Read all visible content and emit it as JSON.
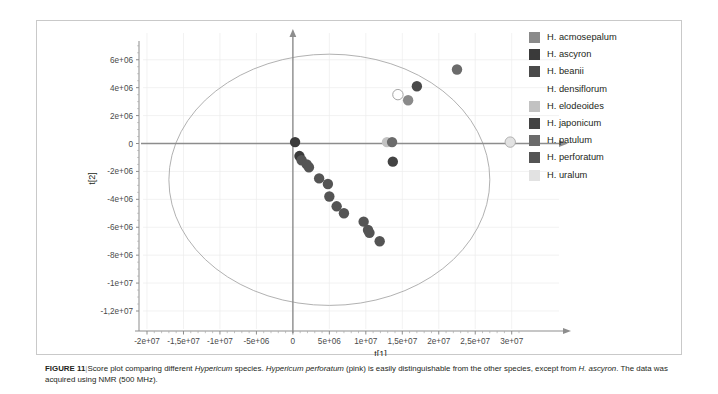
{
  "figure": {
    "number_label": "FIGURE 11",
    "separator": "|",
    "caption_part1": "Score plot comparing different ",
    "caption_italic1": "Hypericum",
    "caption_part2": " species. ",
    "caption_italic2": "Hypericum perforatum",
    "caption_part3": " (pink) is easily distinguishable from the other species, except from ",
    "caption_italic3": "H. ascyron",
    "caption_part4": ". The data was acquired using NMR (500 MHz)."
  },
  "legend": {
    "position": "top-right",
    "items": [
      {
        "label": "H. acmosepalum",
        "color": "#8a8a8a"
      },
      {
        "label": "H. ascyron",
        "color": "#3a3a3a"
      },
      {
        "label": "H. beanii",
        "color": "#4a4a4a"
      },
      {
        "label": "H. densiflorum",
        "color": "#ffffff"
      },
      {
        "label": "H. elodeoides",
        "color": "#c2c2c2"
      },
      {
        "label": "H. japonicum",
        "color": "#434343"
      },
      {
        "label": "H. patulum",
        "color": "#6b6b6b"
      },
      {
        "label": "H. perforatum",
        "color": "#545454"
      },
      {
        "label": "H. uralum",
        "color": "#e2e2e2"
      }
    ]
  },
  "chart_data": {
    "type": "scatter",
    "title": "",
    "xlabel": "t[1]",
    "ylabel": "t[2]",
    "xlim": [
      -20000000,
      31000000
    ],
    "ylim": [
      -12000000,
      7200000
    ],
    "grid": true,
    "confidence_ellipse": {
      "label": "Hotelling T2 (95%)",
      "center_x": 5000000,
      "center_y": -2600000,
      "radius_x": 22000000,
      "radius_y": 9000000
    },
    "xticks": [
      {
        "value": -20000000,
        "label": "-2e+07"
      },
      {
        "value": -15000000,
        "label": "-1,5e+07"
      },
      {
        "value": -10000000,
        "label": "-1e+07"
      },
      {
        "value": -5000000,
        "label": "-5e+06"
      },
      {
        "value": 0,
        "label": "0"
      },
      {
        "value": 5000000,
        "label": "5e+06"
      },
      {
        "value": 10000000,
        "label": "1e+07"
      },
      {
        "value": 15000000,
        "label": "1,5e+07"
      },
      {
        "value": 20000000,
        "label": "2e+07"
      },
      {
        "value": 25000000,
        "label": "2,5e+07"
      },
      {
        "value": 30000000,
        "label": "3e+07"
      }
    ],
    "yticks": [
      {
        "value": 6000000,
        "label": "6e+06"
      },
      {
        "value": 4000000,
        "label": "4e+06"
      },
      {
        "value": 2000000,
        "label": "2e+06"
      },
      {
        "value": 0,
        "label": "0"
      },
      {
        "value": -2000000,
        "label": "-2e+06"
      },
      {
        "value": -4000000,
        "label": "-4e+06"
      },
      {
        "value": -6000000,
        "label": "-6e+06"
      },
      {
        "value": -8000000,
        "label": "-8e+06"
      },
      {
        "value": -10000000,
        "label": "-1e+07"
      },
      {
        "value": -12000000,
        "label": "-1,2e+07"
      }
    ],
    "series": [
      {
        "name": "H. acmosepalum",
        "color": "#8a8a8a",
        "points": [
          {
            "x": 15800000,
            "y": 3100000
          }
        ]
      },
      {
        "name": "H. ascyron",
        "color": "#3a3a3a",
        "points": [
          {
            "x": 300000,
            "y": 100000
          },
          {
            "x": 900000,
            "y": -900000
          }
        ]
      },
      {
        "name": "H. beanii",
        "color": "#4a4a4a",
        "points": [
          {
            "x": 17000000,
            "y": 4100000
          }
        ]
      },
      {
        "name": "H. densiflorum",
        "color": "#ffffff",
        "points": [
          {
            "x": 14400000,
            "y": 3500000
          }
        ]
      },
      {
        "name": "H. elodeoides",
        "color": "#c2c2c2",
        "points": [
          {
            "x": 12900000,
            "y": 100000
          }
        ]
      },
      {
        "name": "H. japonicum",
        "color": "#434343",
        "points": [
          {
            "x": 13700000,
            "y": -1300000
          }
        ]
      },
      {
        "name": "H. patulum",
        "color": "#6b6b6b",
        "points": [
          {
            "x": 13600000,
            "y": 100000
          },
          {
            "x": 22500000,
            "y": 5300000
          }
        ]
      },
      {
        "name": "H. perforatum",
        "color": "#545454",
        "points": [
          {
            "x": 1200000,
            "y": -1200000
          },
          {
            "x": 1900000,
            "y": -1500000
          },
          {
            "x": 2200000,
            "y": -1700000
          },
          {
            "x": 3600000,
            "y": -2500000
          },
          {
            "x": 4800000,
            "y": -2900000
          },
          {
            "x": 5000000,
            "y": -3800000
          },
          {
            "x": 6000000,
            "y": -4500000
          },
          {
            "x": 7000000,
            "y": -5000000
          },
          {
            "x": 9700000,
            "y": -5600000
          },
          {
            "x": 10300000,
            "y": -6200000
          },
          {
            "x": 10500000,
            "y": -6400000
          },
          {
            "x": 11900000,
            "y": -7000000
          }
        ]
      },
      {
        "name": "H. uralum",
        "color": "#e2e2e2",
        "points": [
          {
            "x": 29800000,
            "y": 100000
          }
        ]
      }
    ]
  }
}
